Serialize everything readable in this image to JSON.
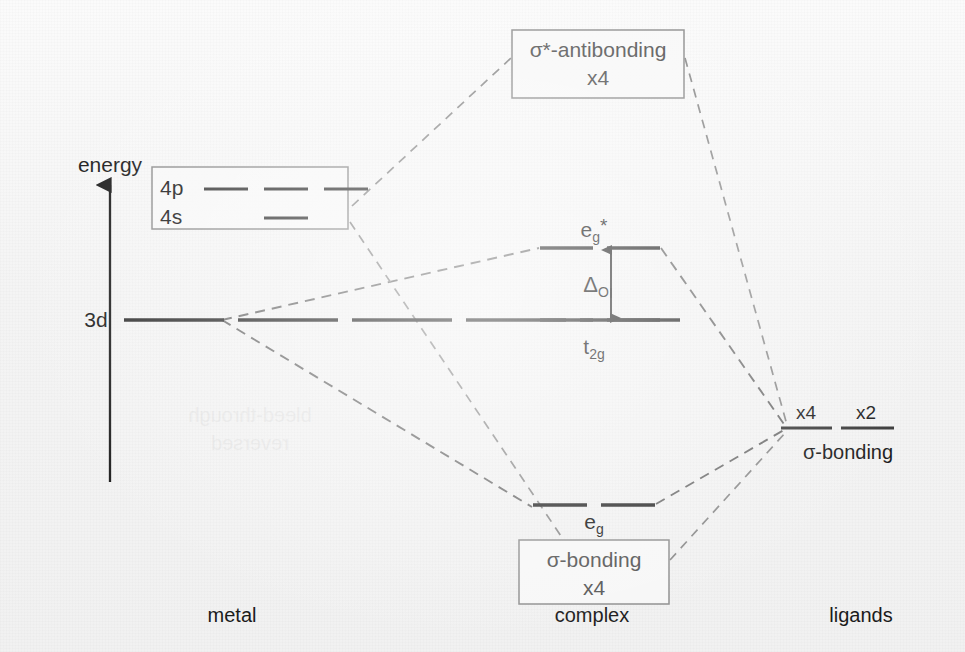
{
  "figure": {
    "type": "molecular-orbital-energy-diagram",
    "background_color": "#f3f3f3",
    "line_color": "#3a3a3a",
    "dashed_correlation_color": "#8b8b8b"
  },
  "axis": {
    "label": "energy",
    "direction": "up",
    "x": 110,
    "y_top": 185,
    "y_bottom": 482,
    "label_x": 110,
    "label_y": 172
  },
  "columns": [
    {
      "key": "metal",
      "label": "metal",
      "x": 232,
      "y": 622
    },
    {
      "key": "complex",
      "label": "complex",
      "x": 592,
      "y": 622
    },
    {
      "key": "ligands",
      "label": "ligands",
      "x": 861,
      "y": 622
    }
  ],
  "metal": {
    "d_level": {
      "label": "3d",
      "label_x": 96,
      "label_y": 327,
      "y": 320,
      "x_start": 124,
      "x_end": 680,
      "dash_count": 5,
      "style": "dashed-long"
    },
    "sp_box": {
      "x": 152,
      "y": 167,
      "width": 196,
      "height": 62,
      "rows": [
        {
          "label": "4p",
          "orbital_count": 3
        },
        {
          "label": "4s",
          "orbital_count": 1
        }
      ]
    }
  },
  "complex": {
    "antibonding_box": {
      "label_line1": "σ*-antibonding",
      "label_line2": "x4",
      "x": 512,
      "y": 30,
      "width": 172,
      "height": 68
    },
    "bonding_box": {
      "label_line1": "σ-bonding",
      "label_line2": "x4",
      "x": 519,
      "y": 540,
      "width": 150,
      "height": 64
    },
    "levels": [
      {
        "key": "eg-star",
        "label": "e",
        "sub": "g",
        "superscript": "*",
        "label_x": 594,
        "label_y": 237,
        "y": 248,
        "x_start": 540,
        "x_end": 660,
        "dash_count": 2
      },
      {
        "key": "t2g",
        "label": "t",
        "sub": "2g",
        "superscript": "",
        "label_x": 594,
        "label_y": 354,
        "y": 320,
        "x_start": 540,
        "x_end": 660,
        "dash_count": 2
      },
      {
        "key": "eg-bonding",
        "label": "e",
        "sub": "g",
        "superscript": "",
        "label_x": 594,
        "label_y": 529,
        "y": 505,
        "x_start": 533,
        "x_end": 655,
        "dash_count": 2
      }
    ],
    "splitting": {
      "label": "Δ",
      "sub": "O",
      "label_x": 596,
      "label_y": 292,
      "arrow_x": 611,
      "y_top": 250,
      "y_bottom": 318
    }
  },
  "ligands": {
    "group_label": "σ-bonding",
    "group_label_x": 848,
    "group_label_y": 459,
    "levels": [
      {
        "label": "x4",
        "label_x": 806,
        "label_y": 419,
        "y": 428,
        "x_start": 781,
        "x_end": 832
      },
      {
        "label": "x2",
        "label_x": 866,
        "label_y": 419,
        "y": 428,
        "x_start": 841,
        "x_end": 894
      }
    ]
  },
  "correlations": [
    {
      "from": "metal-sp-box-top",
      "to": "antibonding-box-left",
      "points": "352,206 511,58"
    },
    {
      "from": "antibonding-box-right",
      "to": "ligand-x4",
      "points": "685,58 787,425"
    },
    {
      "from": "metal-3d",
      "to": "eg-star-left",
      "points": "222,320 539,248"
    },
    {
      "from": "eg-star-right",
      "to": "ligand-x4",
      "points": "661,248 786,427"
    },
    {
      "from": "metal-3d",
      "to": "eg-bonding-left",
      "points": "222,320 532,507"
    },
    {
      "from": "eg-bonding-right",
      "to": "ligand-x4",
      "points": "656,504 784,430"
    },
    {
      "from": "metal-sp-box-bottom",
      "to": "bonding-box-top",
      "points": "350,222 563,539"
    },
    {
      "from": "bonding-box-right",
      "to": "ligand-x4",
      "points": "670,560 786,432"
    }
  ],
  "ghost_text": {
    "line1": "bleed-through",
    "line2": "reversed",
    "x": 250,
    "y1": 422,
    "y2": 450
  }
}
